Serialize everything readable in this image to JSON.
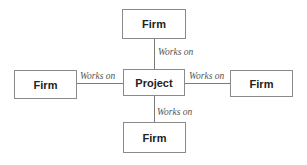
{
  "diagram": {
    "center": {
      "label": "Project"
    },
    "nodes": [
      {
        "position": "top",
        "label": "Firm",
        "edge_label": "Works on"
      },
      {
        "position": "left",
        "label": "Firm",
        "edge_label": "Works on"
      },
      {
        "position": "right",
        "label": "Firm",
        "edge_label": "Works on"
      },
      {
        "position": "bottom",
        "label": "Firm",
        "edge_label": "Works on"
      }
    ]
  }
}
